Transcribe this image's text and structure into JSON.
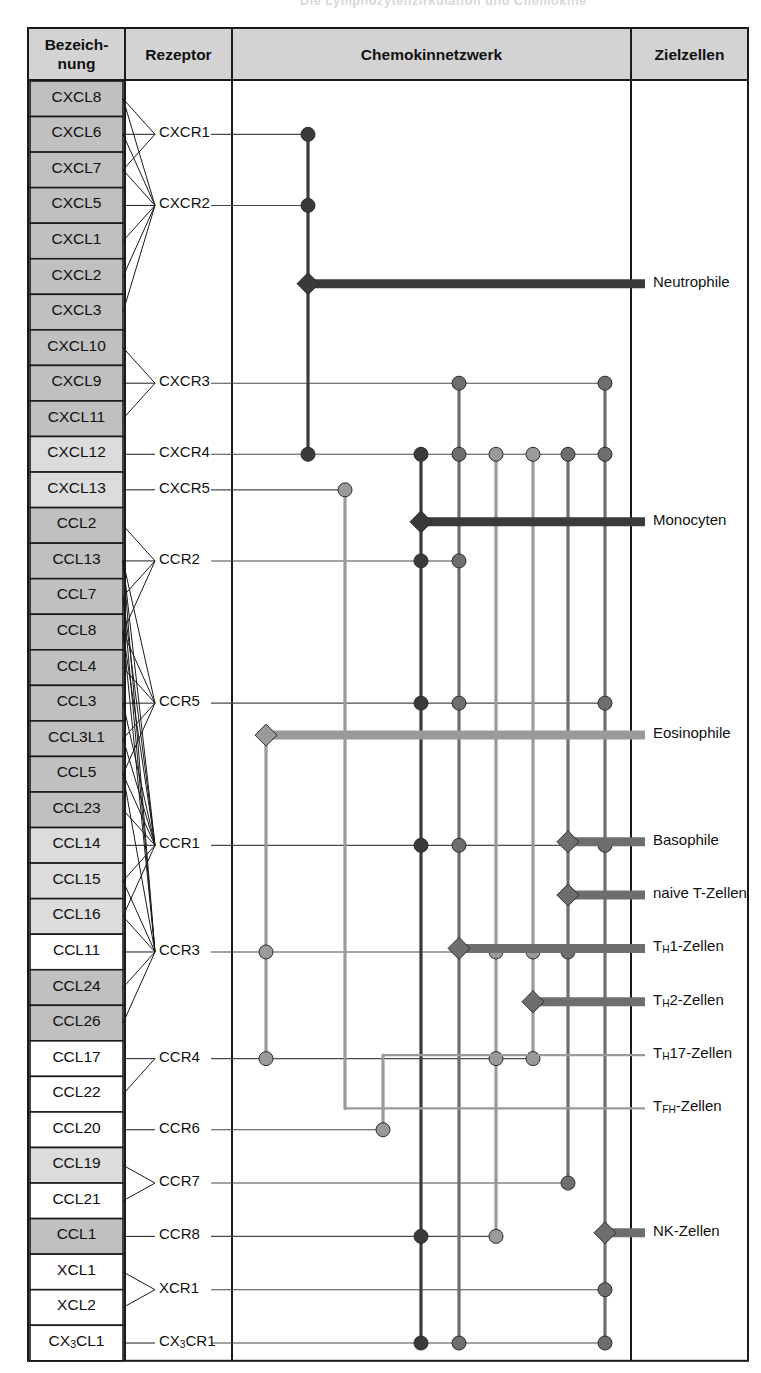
{
  "page": {
    "cut_header": "Die Lymphozytenzirkulation und Chemokine",
    "columns": [
      {
        "key": "bezeichnung",
        "label": "Bezeich-\nnung"
      },
      {
        "key": "rezeptor",
        "label": "Rezeptor"
      },
      {
        "key": "netzwerk",
        "label": "Chemokinnetzwerk"
      },
      {
        "key": "zielzellen",
        "label": "Zielzellen"
      }
    ],
    "colors": {
      "header_fill": "#d3d3d3",
      "row_shaded_dark": "#c0c0c0",
      "row_shaded_light": "#dcdcdc",
      "row_white": "#ffffff",
      "border": "#1a1a1a",
      "node_dark": "#3a3a3a",
      "node_mid": "#6e6e6e",
      "node_light": "#9a9a9a",
      "line_dark": "#3a3a3a",
      "line_mid": "#6e6e6e",
      "line_light": "#9a9a9a"
    }
  },
  "chart_data": {
    "type": "diagram",
    "title": "Chemokinnetzwerk",
    "chemokines": [
      {
        "name": "CXCL8",
        "shade": "dark"
      },
      {
        "name": "CXCL6",
        "shade": "dark"
      },
      {
        "name": "CXCL7",
        "shade": "dark"
      },
      {
        "name": "CXCL5",
        "shade": "dark"
      },
      {
        "name": "CXCL1",
        "shade": "dark"
      },
      {
        "name": "CXCL2",
        "shade": "dark"
      },
      {
        "name": "CXCL3",
        "shade": "dark"
      },
      {
        "name": "CXCL10",
        "shade": "dark"
      },
      {
        "name": "CXCL9",
        "shade": "dark"
      },
      {
        "name": "CXCL11",
        "shade": "dark"
      },
      {
        "name": "CXCL12",
        "shade": "light"
      },
      {
        "name": "CXCL13",
        "shade": "light"
      },
      {
        "name": "CCL2",
        "shade": "dark"
      },
      {
        "name": "CCL13",
        "shade": "dark"
      },
      {
        "name": "CCL7",
        "shade": "dark"
      },
      {
        "name": "CCL8",
        "shade": "dark"
      },
      {
        "name": "CCL4",
        "shade": "dark"
      },
      {
        "name": "CCL3",
        "shade": "dark"
      },
      {
        "name": "CCL3L1",
        "shade": "dark"
      },
      {
        "name": "CCL5",
        "shade": "dark"
      },
      {
        "name": "CCL23",
        "shade": "dark"
      },
      {
        "name": "CCL14",
        "shade": "light"
      },
      {
        "name": "CCL15",
        "shade": "light"
      },
      {
        "name": "CCL16",
        "shade": "light"
      },
      {
        "name": "CCL11",
        "shade": "white"
      },
      {
        "name": "CCL24",
        "shade": "dark"
      },
      {
        "name": "CCL26",
        "shade": "dark"
      },
      {
        "name": "CCL17",
        "shade": "white"
      },
      {
        "name": "CCL22",
        "shade": "white"
      },
      {
        "name": "CCL20",
        "shade": "white"
      },
      {
        "name": "CCL19",
        "shade": "light"
      },
      {
        "name": "CCL21",
        "shade": "white"
      },
      {
        "name": "CCL1",
        "shade": "dark"
      },
      {
        "name": "XCL1",
        "shade": "white"
      },
      {
        "name": "XCL2",
        "shade": "white"
      },
      {
        "name": "CX3CL1",
        "shade": "white",
        "sub": "3"
      }
    ],
    "receptors": [
      {
        "name": "CXCR1",
        "row": 1
      },
      {
        "name": "CXCR2",
        "row": 3
      },
      {
        "name": "CXCR3",
        "row": 8
      },
      {
        "name": "CXCR4",
        "row": 10
      },
      {
        "name": "CXCR5",
        "row": 11
      },
      {
        "name": "CCR2",
        "row": 13
      },
      {
        "name": "CCR5",
        "row": 17
      },
      {
        "name": "CCR1",
        "row": 21
      },
      {
        "name": "CCR3",
        "row": 24
      },
      {
        "name": "CCR4",
        "row": 27
      },
      {
        "name": "CCR6",
        "row": 29
      },
      {
        "name": "CCR7",
        "row": 30.5
      },
      {
        "name": "CCR8",
        "row": 32
      },
      {
        "name": "XCR1",
        "row": 33.5
      },
      {
        "name": "CX3CR1",
        "row": 35,
        "sub": "3"
      }
    ],
    "ligand_receptor_links": [
      [
        "CXCL8",
        "CXCR1"
      ],
      [
        "CXCL8",
        "CXCR2"
      ],
      [
        "CXCL6",
        "CXCR1"
      ],
      [
        "CXCL6",
        "CXCR2"
      ],
      [
        "CXCL7",
        "CXCR1"
      ],
      [
        "CXCL7",
        "CXCR2"
      ],
      [
        "CXCL5",
        "CXCR2"
      ],
      [
        "CXCL1",
        "CXCR2"
      ],
      [
        "CXCL2",
        "CXCR2"
      ],
      [
        "CXCL3",
        "CXCR2"
      ],
      [
        "CXCL10",
        "CXCR3"
      ],
      [
        "CXCL9",
        "CXCR3"
      ],
      [
        "CXCL11",
        "CXCR3"
      ],
      [
        "CXCL12",
        "CXCR4"
      ],
      [
        "CXCL13",
        "CXCR5"
      ],
      [
        "CCL2",
        "CCR2"
      ],
      [
        "CCL13",
        "CCR2"
      ],
      [
        "CCL7",
        "CCR2"
      ],
      [
        "CCL8",
        "CCR2"
      ],
      [
        "CCL13",
        "CCR1"
      ],
      [
        "CCL13",
        "CCR3"
      ],
      [
        "CCL13",
        "CCR5"
      ],
      [
        "CCL7",
        "CCR1"
      ],
      [
        "CCL7",
        "CCR3"
      ],
      [
        "CCL8",
        "CCR1"
      ],
      [
        "CCL8",
        "CCR5"
      ],
      [
        "CCL8",
        "CCR3"
      ],
      [
        "CCL4",
        "CCR5"
      ],
      [
        "CCL3",
        "CCR5"
      ],
      [
        "CCL3",
        "CCR1"
      ],
      [
        "CCL3L1",
        "CCR5"
      ],
      [
        "CCL3L1",
        "CCR1"
      ],
      [
        "CCL5",
        "CCR5"
      ],
      [
        "CCL5",
        "CCR1"
      ],
      [
        "CCL5",
        "CCR3"
      ],
      [
        "CCL23",
        "CCR1"
      ],
      [
        "CCL14",
        "CCR1"
      ],
      [
        "CCL15",
        "CCR1"
      ],
      [
        "CCL15",
        "CCR3"
      ],
      [
        "CCL16",
        "CCR1"
      ],
      [
        "CCL16",
        "CCR3"
      ],
      [
        "CCL11",
        "CCR3"
      ],
      [
        "CCL24",
        "CCR3"
      ],
      [
        "CCL26",
        "CCR3"
      ],
      [
        "CCL17",
        "CCR4"
      ],
      [
        "CCL22",
        "CCR4"
      ],
      [
        "CCL20",
        "CCR6"
      ],
      [
        "CCL19",
        "CCR7"
      ],
      [
        "CCL21",
        "CCR7"
      ],
      [
        "CCL1",
        "CCR8"
      ],
      [
        "XCL1",
        "XCR1"
      ],
      [
        "XCL2",
        "XCR1"
      ],
      [
        "CX3CL1",
        "CX3CR1"
      ]
    ],
    "target_cells": [
      {
        "name": "Neutrophile",
        "row": 5.2,
        "weight": "heavy",
        "tone": "dark",
        "hub_x": 308
      },
      {
        "name": "Monocyten",
        "row": 11.9,
        "weight": "heavy",
        "tone": "dark",
        "hub_x": 421
      },
      {
        "name": "Eosinophile",
        "row": 17.9,
        "weight": "heavy",
        "tone": "light",
        "hub_x": 266
      },
      {
        "name": "Basophile",
        "row": 20.9,
        "weight": "heavy",
        "tone": "mid",
        "hub_x": 568
      },
      {
        "name": "naive T-Zellen",
        "row": 22.4,
        "weight": "heavy",
        "tone": "mid",
        "hub_x": 568
      },
      {
        "name": "TH1-Zellen",
        "row": 23.9,
        "weight": "heavy",
        "tone": "mid",
        "hub_x": 459,
        "html": "T<sub>H</sub>1-Zellen"
      },
      {
        "name": "TH2-Zellen",
        "row": 25.4,
        "weight": "heavy",
        "tone": "mid",
        "hub_x": 533,
        "html": "T<sub>H</sub>2-Zellen"
      },
      {
        "name": "TH17-Zellen",
        "row": 26.9,
        "weight": "light",
        "tone": "light",
        "hub_x": 383,
        "html": "T<sub>H</sub>17-Zellen"
      },
      {
        "name": "TFH-Zellen",
        "row": 28.4,
        "weight": "light",
        "tone": "light",
        "hub_x": 345,
        "html": "T<sub>FH</sub>-Zellen"
      },
      {
        "name": "NK-Zellen",
        "row": 31.9,
        "weight": "heavy",
        "tone": "mid",
        "hub_x": 605
      }
    ],
    "network_columns_x": [
      266,
      308,
      345,
      383,
      421,
      459,
      496,
      533,
      568,
      605
    ],
    "receptor_node_rows": {
      "CXCR1": [
        308
      ],
      "CXCR2": [
        308
      ],
      "CXCR3": [
        459,
        605
      ],
      "CXCR4": [
        308,
        421,
        459,
        496,
        533,
        568,
        605
      ],
      "CXCR5": [
        345
      ],
      "CCR2": [
        421,
        459
      ],
      "CCR5": [
        421,
        459,
        605
      ],
      "CCR1": [
        421,
        459,
        605
      ],
      "CCR3": [
        266,
        496,
        533,
        568
      ],
      "CCR4": [
        266,
        496,
        533
      ],
      "CCR6": [
        383
      ],
      "CCR7": [
        568
      ],
      "CCR8": [
        421,
        496
      ],
      "XCR1": [
        605
      ],
      "CX3CR1": [
        421,
        459,
        605
      ]
    }
  }
}
